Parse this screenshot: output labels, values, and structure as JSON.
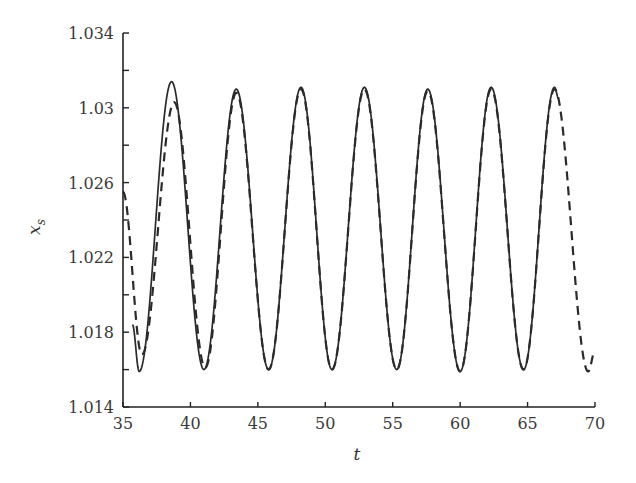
{
  "chart_data": {
    "type": "line",
    "title": "",
    "xlabel": "t",
    "ylabel": "x_s",
    "xlim": [
      35,
      70
    ],
    "ylim": [
      1.014,
      1.034
    ],
    "grid": false,
    "legend": null,
    "x_ticks": [
      35,
      40,
      45,
      50,
      55,
      60,
      65,
      70
    ],
    "x_tick_labels": [
      "35",
      "40",
      "45",
      "50",
      "55",
      "60",
      "65",
      "70"
    ],
    "y_ticks": [
      1.014,
      1.018,
      1.022,
      1.026,
      1.03,
      1.034
    ],
    "y_tick_labels": [
      "1.014",
      "1.018",
      "1.022",
      "1.026",
      "1.03",
      "1.034"
    ],
    "y_minor_ticks": [
      1.016,
      1.02,
      1.024,
      1.028,
      1.032
    ],
    "series": [
      {
        "name": "solid",
        "style": "solid",
        "x_range": [
          35.7,
          67.3
        ],
        "period": 4.73,
        "points": [
          {
            "t": 35.7,
            "x": 1.0184
          },
          {
            "t": 36.2,
            "x": 1.0159
          },
          {
            "t": 38.6,
            "x": 1.0314
          },
          {
            "t": 41.0,
            "x": 1.016
          },
          {
            "t": 43.4,
            "x": 1.031
          },
          {
            "t": 45.8,
            "x": 1.016
          },
          {
            "t": 48.2,
            "x": 1.0311
          },
          {
            "t": 50.5,
            "x": 1.016
          },
          {
            "t": 52.9,
            "x": 1.0311
          },
          {
            "t": 55.3,
            "x": 1.016
          },
          {
            "t": 57.6,
            "x": 1.031
          },
          {
            "t": 60.0,
            "x": 1.0159
          },
          {
            "t": 62.3,
            "x": 1.0311
          },
          {
            "t": 64.7,
            "x": 1.016
          },
          {
            "t": 67.0,
            "x": 1.0311
          },
          {
            "t": 67.3,
            "x": 1.0305
          }
        ]
      },
      {
        "name": "dashed",
        "style": "dashed",
        "x_range": [
          35,
          70
        ],
        "period": 4.73,
        "points": [
          {
            "t": 35.0,
            "x": 1.0255
          },
          {
            "t": 36.4,
            "x": 1.0168
          },
          {
            "t": 38.8,
            "x": 1.0303
          },
          {
            "t": 41.1,
            "x": 1.0161
          },
          {
            "t": 43.4,
            "x": 1.0308
          },
          {
            "t": 45.8,
            "x": 1.016
          },
          {
            "t": 48.2,
            "x": 1.031
          },
          {
            "t": 50.5,
            "x": 1.016
          },
          {
            "t": 52.9,
            "x": 1.031
          },
          {
            "t": 55.3,
            "x": 1.016
          },
          {
            "t": 57.6,
            "x": 1.0309
          },
          {
            "t": 60.0,
            "x": 1.0159
          },
          {
            "t": 62.3,
            "x": 1.031
          },
          {
            "t": 64.7,
            "x": 1.016
          },
          {
            "t": 67.0,
            "x": 1.031
          },
          {
            "t": 69.5,
            "x": 1.0159
          },
          {
            "t": 70.0,
            "x": 1.017
          }
        ]
      }
    ]
  }
}
